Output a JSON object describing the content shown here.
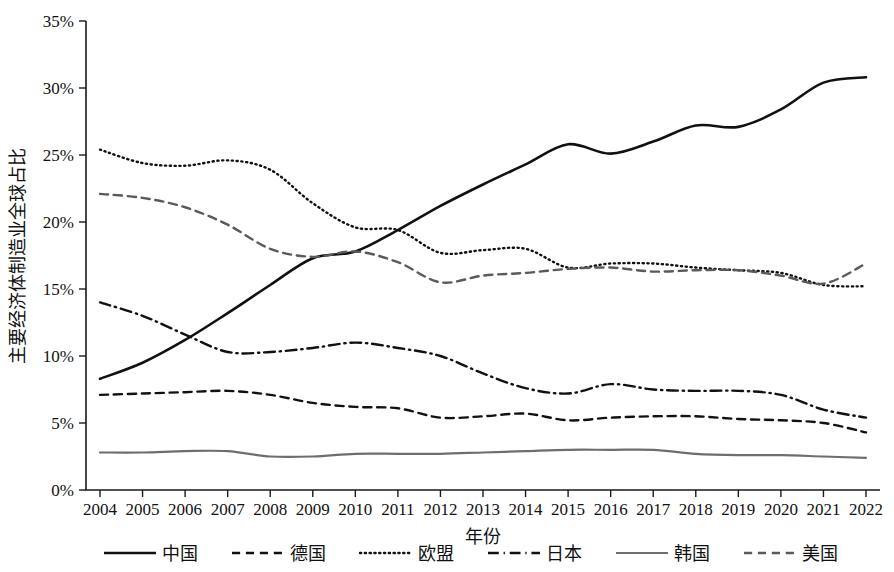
{
  "chart_data": {
    "type": "line",
    "title": "",
    "xlabel": "年份",
    "ylabel": "主要经济体制造业全球占比",
    "xlim": [
      2004,
      2022
    ],
    "ylim": [
      0,
      35
    ],
    "grid": false,
    "legend_position": "bottom",
    "y_tick_labels": [
      "0%",
      "5%",
      "10%",
      "15%",
      "20%",
      "25%",
      "30%",
      "35%"
    ],
    "y_tick_values": [
      0,
      5,
      10,
      15,
      20,
      25,
      30,
      35
    ],
    "x": [
      2004,
      2005,
      2006,
      2007,
      2008,
      2009,
      2010,
      2011,
      2012,
      2013,
      2014,
      2015,
      2016,
      2017,
      2018,
      2019,
      2020,
      2021,
      2022
    ],
    "x_tick_labels": [
      "2004",
      "2005",
      "2006",
      "2007",
      "2008",
      "2009",
      "2010",
      "2011",
      "2012",
      "2013",
      "2014",
      "2015",
      "2016",
      "2017",
      "2018",
      "2019",
      "2020",
      "2021",
      "2022"
    ],
    "series": [
      {
        "name": "中国",
        "key": "china",
        "color": "#111111",
        "dash": "none",
        "width": 2.6,
        "values": [
          8.3,
          9.5,
          11.2,
          13.2,
          15.3,
          17.3,
          17.8,
          19.4,
          21.2,
          22.8,
          24.3,
          25.8,
          25.1,
          26.0,
          27.2,
          27.1,
          28.4,
          30.4,
          30.8
        ]
      },
      {
        "name": "德国",
        "key": "germany",
        "color": "#111111",
        "dash": "dashed",
        "width": 2.4,
        "values": [
          7.1,
          7.2,
          7.3,
          7.4,
          7.1,
          6.5,
          6.2,
          6.1,
          5.4,
          5.5,
          5.7,
          5.2,
          5.4,
          5.5,
          5.5,
          5.3,
          5.2,
          5.0,
          4.3
        ]
      },
      {
        "name": "欧盟",
        "key": "eu",
        "color": "#111111",
        "dash": "dotted",
        "width": 2.4,
        "values": [
          25.4,
          24.4,
          24.2,
          24.6,
          23.9,
          21.4,
          19.6,
          19.4,
          17.7,
          17.9,
          18.0,
          16.6,
          16.9,
          16.9,
          16.6,
          16.4,
          16.2,
          15.3,
          15.2
        ]
      },
      {
        "name": "日本",
        "key": "japan",
        "color": "#111111",
        "dash": "dashdot",
        "width": 2.4,
        "values": [
          14.0,
          13.0,
          11.6,
          10.3,
          10.3,
          10.6,
          11.0,
          10.6,
          10.0,
          8.7,
          7.6,
          7.2,
          7.9,
          7.5,
          7.4,
          7.4,
          7.1,
          6.0,
          5.4
        ]
      },
      {
        "name": "韩国",
        "key": "korea",
        "color": "#6e6e6e",
        "dash": "none",
        "width": 2.2,
        "values": [
          2.8,
          2.8,
          2.9,
          2.9,
          2.5,
          2.5,
          2.7,
          2.7,
          2.7,
          2.8,
          2.9,
          3.0,
          3.0,
          3.0,
          2.7,
          2.6,
          2.6,
          2.5,
          2.4
        ]
      },
      {
        "name": "美国",
        "key": "usa",
        "color": "#5a5a5a",
        "dash": "dashed",
        "width": 2.4,
        "values": [
          22.1,
          21.8,
          21.1,
          19.8,
          18.0,
          17.4,
          17.8,
          17.0,
          15.5,
          16.0,
          16.2,
          16.5,
          16.6,
          16.3,
          16.4,
          16.4,
          16.0,
          15.4,
          16.9
        ]
      }
    ],
    "legend": [
      {
        "label": "中国",
        "key": "china",
        "color": "#111111",
        "dash": "none"
      },
      {
        "label": "德国",
        "key": "germany",
        "color": "#111111",
        "dash": "dashed"
      },
      {
        "label": "欧盟",
        "key": "eu",
        "color": "#111111",
        "dash": "dotted"
      },
      {
        "label": "日本",
        "key": "japan",
        "color": "#111111",
        "dash": "dashdot"
      },
      {
        "label": "韩国",
        "key": "korea",
        "color": "#6e6e6e",
        "dash": "none"
      },
      {
        "label": "美国",
        "key": "usa",
        "color": "#5a5a5a",
        "dash": "dashed"
      }
    ]
  }
}
